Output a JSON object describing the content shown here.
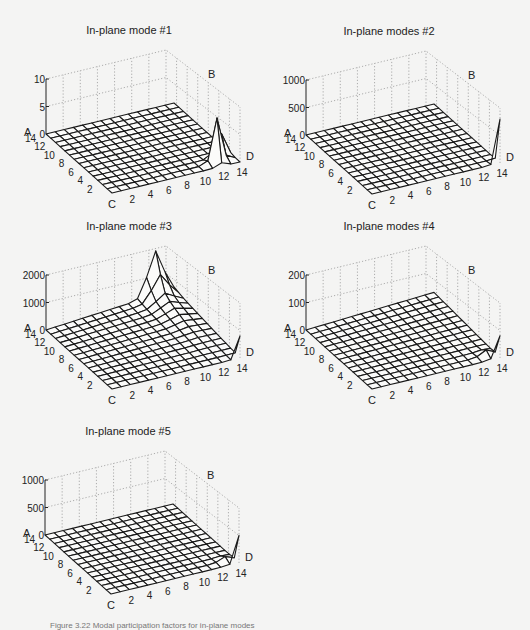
{
  "figure": {
    "caption": "Figure 3.22  Modal participation factors for in-plane modes"
  },
  "chart_data": [
    {
      "type": "surface3d",
      "title": "In-plane mode #1",
      "origin": [
        46,
        134
      ],
      "zticks": [
        "0",
        "5",
        "10"
      ],
      "zmax": 10,
      "corner_labels": {
        "A": "A",
        "B": "B",
        "C": "C",
        "D": "D"
      },
      "xticks": [
        "2",
        "4",
        "6",
        "8",
        "10",
        "12",
        "14"
      ],
      "yticks": [
        "2",
        "4",
        "6",
        "8",
        "10",
        "12",
        "14"
      ],
      "grid_size": 15,
      "surface": "flat with sharp peak near corner D (x=13-14, y=2-3) reaching ~8",
      "peaks": [
        {
          "x": 13,
          "y": 2,
          "z": 8
        },
        {
          "x": 14,
          "y": 2,
          "z": 5
        }
      ]
    },
    {
      "type": "surface3d",
      "title": "In-plane modes #2",
      "origin": [
        306,
        135
      ],
      "zticks": [
        "0",
        "500",
        "1000"
      ],
      "zmax": 1000,
      "corner_labels": {
        "A": "A",
        "B": "B",
        "C": "C",
        "D": "D"
      },
      "xticks": [
        "2",
        "4",
        "6",
        "8",
        "10",
        "12",
        "14"
      ],
      "yticks": [
        "2",
        "4",
        "6",
        "8",
        "10",
        "12",
        "14"
      ],
      "grid_size": 15,
      "surface": "flat with single tall spike at corner D reaching ~800",
      "peaks": [
        {
          "x": 14,
          "y": 1,
          "z": 800
        }
      ]
    },
    {
      "type": "surface3d",
      "title": "In-plane mode #3",
      "origin": [
        46,
        330
      ],
      "zticks": [
        "0",
        "1000",
        "2000"
      ],
      "zmax": 2000,
      "corner_labels": {
        "A": "A",
        "B": "B",
        "C": "C",
        "D": "D"
      },
      "xticks": [
        "2",
        "4",
        "6",
        "8",
        "10",
        "12",
        "14"
      ],
      "yticks": [
        "2",
        "4",
        "6",
        "8",
        "10",
        "12",
        "14"
      ],
      "grid_size": 15,
      "surface": "rises gently toward back edge (B), ridge ~1000 near x=12-13 on back edge, spike at D ~800",
      "peaks": [
        {
          "x": 13,
          "y": 15,
          "z": 1000
        },
        {
          "x": 14,
          "y": 1,
          "z": 800
        }
      ]
    },
    {
      "type": "surface3d",
      "title": "In-plane modes #4",
      "origin": [
        306,
        330
      ],
      "zticks": [
        "0",
        "100",
        "200"
      ],
      "zmax": 200,
      "corner_labels": {
        "A": "A",
        "B": "B",
        "C": "C",
        "D": "D"
      },
      "xticks": [
        "2",
        "4",
        "6",
        "8",
        "10",
        "12",
        "14"
      ],
      "yticks": [
        "2",
        "4",
        "6",
        "8",
        "10",
        "12",
        "14"
      ],
      "grid_size": 15,
      "surface": "slight rise toward back, spike at D ~80",
      "peaks": [
        {
          "x": 14,
          "y": 1,
          "z": 80
        }
      ]
    },
    {
      "type": "surface3d",
      "title": "In-plane mode #5",
      "origin": [
        45,
        535
      ],
      "zticks": [
        "0",
        "500",
        "1000"
      ],
      "zmax": 1000,
      "corner_labels": {
        "A": "A",
        "B": "B",
        "C": "C",
        "D": "D"
      },
      "xticks": [
        "2",
        "4",
        "6",
        "8",
        "10",
        "12",
        "14"
      ],
      "yticks": [
        "2",
        "4",
        "6",
        "8",
        "10",
        "12",
        "14"
      ],
      "grid_size": 15,
      "surface": "flat, spike at D ~500",
      "peaks": [
        {
          "x": 14,
          "y": 1,
          "z": 500
        }
      ]
    }
  ]
}
